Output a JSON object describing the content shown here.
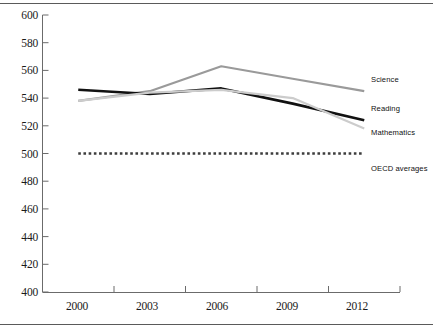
{
  "chart_data": {
    "type": "line",
    "title": "",
    "xlabel": "",
    "ylabel": "",
    "categories": [
      "2000",
      "2003",
      "2006",
      "2009",
      "2012"
    ],
    "x": [
      2000,
      2003,
      2006,
      2009,
      2012
    ],
    "ylim": [
      400,
      600
    ],
    "yticks": [
      400,
      420,
      440,
      460,
      480,
      500,
      520,
      540,
      560,
      580,
      600
    ],
    "grid": false,
    "legend_position": "right-inline",
    "series": [
      {
        "name": "Science",
        "color": "#9a9a9a",
        "style": "solid",
        "values": [
          538,
          545,
          563,
          554,
          545
        ]
      },
      {
        "name": "Reading",
        "color": "#111111",
        "style": "solid",
        "values": [
          546,
          543,
          547,
          536,
          524
        ]
      },
      {
        "name": "Mathematics",
        "color": "#cccccc",
        "style": "solid",
        "values": [
          538,
          544,
          546,
          540,
          518
        ]
      },
      {
        "name": "OECD averages",
        "color": "#3d3d3d",
        "style": "dotted",
        "values": [
          500,
          500,
          500,
          500,
          500
        ]
      }
    ]
  },
  "axis": {
    "y_tick_labels": [
      "600",
      "580",
      "560",
      "540",
      "520",
      "500",
      "480",
      "460",
      "440",
      "420",
      "400"
    ],
    "x_tick_labels": [
      "2000",
      "2003",
      "2006",
      "2009",
      "2012"
    ]
  },
  "legend": {
    "items": [
      {
        "label": "Science"
      },
      {
        "label": "Reading"
      },
      {
        "label": "Mathematics"
      },
      {
        "label": "OECD averages"
      }
    ]
  },
  "colors": {
    "science": "#9a9a9a",
    "reading": "#111111",
    "mathematics": "#cccccc",
    "oecd": "#3d3d3d",
    "axis": "#6b6b6b",
    "rule": "#5a5a5a"
  }
}
